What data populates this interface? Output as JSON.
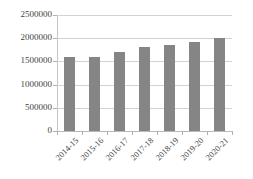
{
  "chart_data": {
    "type": "bar",
    "title": "",
    "subtitle": "",
    "xlabel": "",
    "ylabel": "",
    "categories": [
      "2014-15",
      "2015-16",
      "2016-17",
      "2017-18",
      "2018-19",
      "2019-20",
      "2020-21"
    ],
    "values": [
      1595000,
      1600000,
      1700000,
      1810000,
      1855000,
      1920000,
      2005000
    ],
    "series": [
      {
        "name": "",
        "values": [
          1595000,
          1600000,
          1700000,
          1810000,
          1855000,
          1920000,
          2005000
        ]
      }
    ],
    "ylim": [
      0,
      2500000
    ],
    "y_ticks": [
      0,
      500000,
      1000000,
      1500000,
      2000000,
      2500000
    ],
    "y_tick_labels": [
      "0",
      "500000",
      "1000000",
      "1500000",
      "2000000",
      "2500000"
    ],
    "grid": true,
    "grid_axis": "y",
    "legend": false,
    "legend_position": "none",
    "bar_color": "#858585",
    "gridline_color": "#d2d2d2",
    "axis_color": "#b9b9b9",
    "text_color": "#3f3f3f",
    "background": "#ffffff",
    "x_tick_label_rotation": -45,
    "annotations": []
  }
}
